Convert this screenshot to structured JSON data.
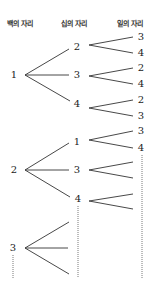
{
  "headers": {
    "hundreds": "백의 자리",
    "tens": "십의 자리",
    "ones": "일의 자리"
  },
  "tree": {
    "hundreds": [
      {
        "digit": "1",
        "x": 14,
        "y": 75
      },
      {
        "digit": "2",
        "x": 14,
        "y": 170
      },
      {
        "digit": "3",
        "x": 13,
        "y": 248
      }
    ],
    "tens": [
      {
        "digit": "2",
        "x": 77,
        "y": 47
      },
      {
        "digit": "3",
        "x": 77,
        "y": 75
      },
      {
        "digit": "4",
        "x": 77,
        "y": 104
      },
      {
        "digit": "1",
        "x": 77,
        "y": 142
      },
      {
        "digit": "3",
        "x": 77,
        "y": 170
      },
      {
        "digit": "4",
        "x": 78,
        "y": 199
      }
    ],
    "ones": [
      {
        "digit": "3",
        "x": 141,
        "y": 37
      },
      {
        "digit": "4",
        "x": 141,
        "y": 53
      },
      {
        "digit": "2",
        "x": 141,
        "y": 68
      },
      {
        "digit": "4",
        "x": 141,
        "y": 84
      },
      {
        "digit": "2",
        "x": 141,
        "y": 100
      },
      {
        "digit": "3",
        "x": 141,
        "y": 116
      },
      {
        "digit": "3",
        "x": 141,
        "y": 131
      },
      {
        "digit": "4",
        "x": 141,
        "y": 148
      }
    ]
  },
  "colors": {
    "line": "#333333",
    "dotted": "#555555"
  }
}
